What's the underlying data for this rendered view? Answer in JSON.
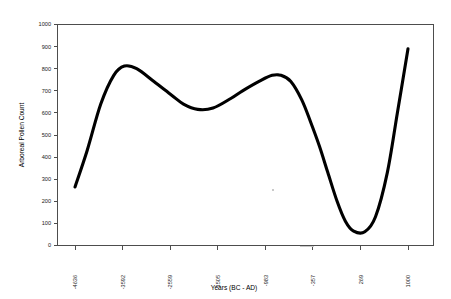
{
  "chart_data": {
    "type": "line",
    "title": "",
    "xlabel": "Years (BC - AD)",
    "ylabel": "Arboreal Pollen Count",
    "grid": false,
    "legend": null,
    "legend_position": "none",
    "xlim": [
      -4636,
      1000
    ],
    "ylim": [
      0,
      1000
    ],
    "ytick_labels": [
      "0",
      "100",
      "200",
      "300",
      "400",
      "500",
      "600",
      "700",
      "800",
      "900",
      "1000"
    ],
    "ytick_values": [
      0,
      100,
      200,
      300,
      400,
      500,
      600,
      700,
      800,
      900,
      1000
    ],
    "xtick_labels": [
      "-4636",
      "-3592",
      "-2559",
      "-1505",
      "-983",
      "-357",
      "269",
      "1000"
    ],
    "xtick_values": [
      -4636,
      -3592,
      -2559,
      -1505,
      -983,
      -357,
      269,
      1000
    ],
    "series": [
      {
        "name": "Arboreal Pollen Count",
        "color": "#000000",
        "x": [
          -4636,
          -4430,
          -4200,
          -3980,
          -3800,
          -3592,
          -3300,
          -3000,
          -2800,
          -2559,
          -2300,
          -2000,
          -1800,
          -1505,
          -1300,
          -1150,
          -983,
          -800,
          -650,
          -500,
          -357,
          -200,
          -60,
          80,
          269,
          450,
          650,
          820,
          1000
        ],
        "y": [
          265,
          430,
          640,
          770,
          812,
          800,
          742,
          680,
          640,
          616,
          622,
          665,
          700,
          745,
          770,
          770,
          742,
          660,
          560,
          450,
          330,
          200,
          110,
          65,
          62,
          130,
          330,
          600,
          890
        ]
      }
    ],
    "annotations": []
  },
  "figure": {
    "background_color": "#ffffff",
    "axis_color": "#4d4d4d",
    "line_color": "#000000",
    "text_color": "#000000"
  }
}
